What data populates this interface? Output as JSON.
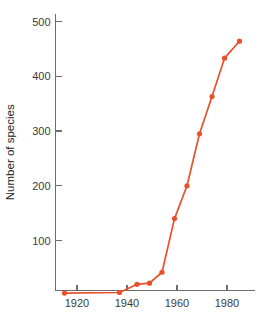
{
  "chart_data": {
    "type": "line",
    "title": "",
    "subtitle": "",
    "xlabel": "",
    "ylabel": "Number of species",
    "xlim": [
      1910,
      1990
    ],
    "ylim": [
      0,
      520
    ],
    "xticks": [
      1920,
      1940,
      1960,
      1980
    ],
    "xtick_labels": [
      "1920",
      "1940",
      "1960",
      "1980"
    ],
    "yticks": [
      100,
      200,
      300,
      400,
      500
    ],
    "ytick_labels": [
      "100",
      "200",
      "300",
      "400",
      "500"
    ],
    "grid": false,
    "legend": false,
    "legend_position": "none",
    "series": [
      {
        "name": "Number of species",
        "color": "#E8512A",
        "marker": "circle",
        "x": [
          1915,
          1937,
          1944,
          1949,
          1954,
          1959,
          1964,
          1969,
          1974,
          1979,
          1985
        ],
        "y": [
          4,
          5,
          20,
          22,
          42,
          140,
          200,
          295,
          363,
          433,
          464
        ],
        "points": [
          {
            "x": 1915,
            "y": 4
          },
          {
            "x": 1937,
            "y": 5
          },
          {
            "x": 1944,
            "y": 20
          },
          {
            "x": 1949,
            "y": 22
          },
          {
            "x": 1954,
            "y": 42
          },
          {
            "x": 1959,
            "y": 140
          },
          {
            "x": 1964,
            "y": 200
          },
          {
            "x": 1969,
            "y": 295
          },
          {
            "x": 1974,
            "y": 363
          },
          {
            "x": 1979,
            "y": 433
          },
          {
            "x": 1985,
            "y": 464
          }
        ]
      }
    ]
  },
  "style": {
    "background": "#ffffff",
    "axis_color": "#6d6d6d",
    "tick_label_color": "#3b3b3b",
    "axis_title_color": "#262626",
    "series_color": "#E8512A"
  }
}
